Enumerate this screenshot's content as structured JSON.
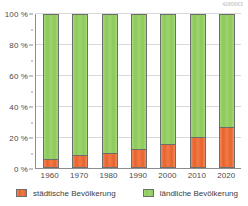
{
  "watermark": "4280663",
  "chart_data": {
    "type": "bar",
    "subtype": "stacked-bar-100-percent",
    "title": "",
    "subtitle": "",
    "xlabel": "",
    "ylabel": "",
    "categories": [
      "1960",
      "1970",
      "1980",
      "1990",
      "2000",
      "2010",
      "2020"
    ],
    "series": [
      {
        "name": "städtische Bevölkerung",
        "color": "#e8612c",
        "values": [
          5,
          8,
          9,
          12,
          15,
          20,
          26
        ]
      },
      {
        "name": "ländliche Bevölkerung",
        "color": "#8cc95a",
        "values": [
          95,
          92,
          91,
          88,
          85,
          80,
          74
        ]
      }
    ],
    "ylim": [
      0,
      100
    ],
    "y_ticks": [
      "0 %",
      "20 %",
      "40 %",
      "60 %",
      "80 %",
      "100 %"
    ],
    "y_tick_values": [
      0,
      20,
      40,
      60,
      80,
      100
    ],
    "y_unit": "%",
    "grid": true,
    "legend_position": "bottom"
  },
  "legend": {
    "items": [
      {
        "label": "städtische Bevölkerung",
        "color": "#e8612c"
      },
      {
        "label": "ländliche Bevölkerung",
        "color": "#8cc95a"
      }
    ]
  },
  "colors": {
    "urban": "#e8612c",
    "rural": "#8cc95a",
    "axis": "#8d8d8d",
    "grid": "#d8d8d8",
    "text": "#4a4a4a",
    "background": "#ffffff"
  }
}
